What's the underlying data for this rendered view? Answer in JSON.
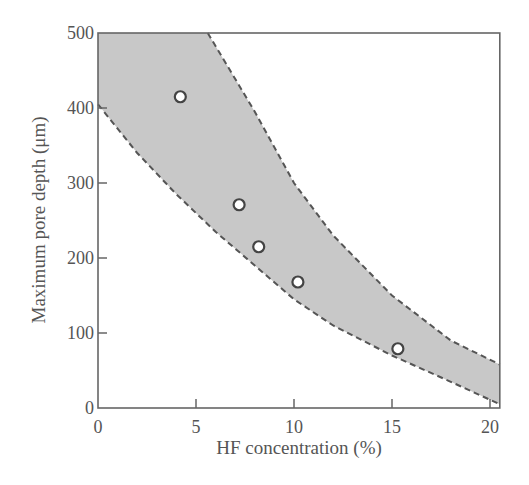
{
  "chart_data": {
    "type": "scatter",
    "title": "",
    "xlabel": "HF concentration (%)",
    "ylabel": "Maximum pore depth (μm)",
    "xlim": [
      0,
      20.5
    ],
    "ylim": [
      0,
      500
    ],
    "xticks": [
      0,
      5,
      10,
      15,
      20
    ],
    "yticks": [
      0,
      100,
      200,
      300,
      400,
      500
    ],
    "grid": false,
    "legend": null,
    "series": [
      {
        "name": "measured",
        "marker": "open-circle",
        "x": [
          4.2,
          7.2,
          8.2,
          10.2,
          15.3
        ],
        "y": [
          415,
          271,
          215,
          168,
          79
        ]
      }
    ],
    "band": {
      "name": "shaded range",
      "fill": "#c8c8c8",
      "upper": {
        "x": [
          0,
          5.6,
          8,
          10,
          12,
          15,
          18,
          20.5
        ],
        "y": [
          500,
          500,
          395,
          300,
          230,
          150,
          90,
          58
        ]
      },
      "lower": {
        "x": [
          0,
          2,
          4,
          6,
          8,
          10,
          12,
          15,
          18,
          20.5
        ],
        "y": [
          405,
          340,
          285,
          235,
          190,
          145,
          110,
          70,
          35,
          5
        ]
      }
    }
  },
  "labels": {
    "x_axis": "HF concentration (%)",
    "y_axis": "Maximum pore depth (μm)",
    "xticks": [
      "0",
      "5",
      "10",
      "15",
      "20"
    ],
    "yticks": [
      "0",
      "100",
      "200",
      "300",
      "400",
      "500"
    ]
  }
}
